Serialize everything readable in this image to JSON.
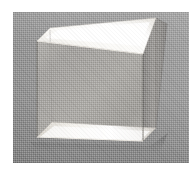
{
  "image": {
    "kind": "photograph",
    "subject": "transparent rectangular slab",
    "description": "Black-and-white halftone photograph of a clear rectangular glass or acrylic block standing upright on a flat surface, photographed at a three-quarter angle against a plain gray backdrop.",
    "orientation": "three-quarter view",
    "background_color": "#9c9c9c",
    "page_color": "#ffffff",
    "frame": {
      "left": 13,
      "top": 12,
      "width": 176,
      "height": 151
    }
  },
  "object": {
    "name": "rectangular-slab",
    "material": "transparent glass",
    "faces": [
      {
        "name": "top-face",
        "tone": "#f4f2ee",
        "label": "top"
      },
      {
        "name": "front-face",
        "tone": "#a9a7a4",
        "label": "front"
      },
      {
        "name": "right-side-face",
        "tone": "#969492",
        "label": "right side"
      },
      {
        "name": "bottom-face",
        "tone": "#ece9e4",
        "label": "bottom"
      }
    ],
    "highlights": [
      {
        "name": "top-specular-highlight",
        "tone": "#ffffff"
      },
      {
        "name": "bottom-reflection",
        "tone": "#f2efe9"
      }
    ],
    "edges": [
      {
        "name": "front-left-vertical-edge"
      },
      {
        "name": "front-right-vertical-edge"
      },
      {
        "name": "back-right-vertical-edge"
      },
      {
        "name": "top-front-edge"
      },
      {
        "name": "top-back-edge"
      },
      {
        "name": "bottom-front-edge"
      }
    ]
  },
  "geometry": {
    "top_face_points": "37,41 50,28 156,18 143,54",
    "front_face_points": "37,41 143,54 143,141 37,137",
    "right_face_points": "143,54 156,18 167,24 156,128 143,141",
    "bottom_face_points": "37,137 143,141 156,128 52,122",
    "top_highlight_points": "45,38 58,30 150,22 140,46",
    "bottom_highlight_points": "40,137 140,141 150,131 54,126",
    "shadow_points": "30,142 150,146 168,133 160,152 36,150"
  },
  "notes": {
    "no_text": "no visible text in image"
  }
}
